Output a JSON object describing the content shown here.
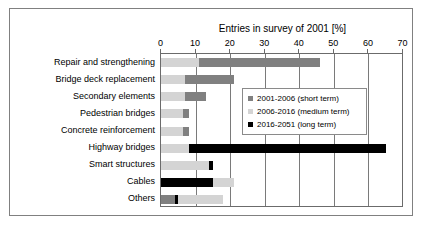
{
  "chart_data": {
    "type": "bar",
    "orientation": "horizontal",
    "stacked": true,
    "title": "Entries in survey of 2001 [%]",
    "xlabel": "",
    "ylabel": "",
    "xlim": [
      0,
      70
    ],
    "xticks": [
      0,
      10,
      20,
      30,
      40,
      50,
      60,
      70
    ],
    "grid": true,
    "legend_position": "inside-right",
    "categories": [
      "Repair and strengthening",
      "Bridge deck replacement",
      "Secondary elements",
      "Pedestrian bridges",
      "Concrete reinforcement",
      "Highway bridges",
      "Smart structures",
      "Cables",
      "Others"
    ],
    "series": [
      {
        "name": "2001-2006 (short term)",
        "color": "#808080",
        "values": [
          35,
          14,
          6,
          1.5,
          1.5,
          0,
          0,
          0,
          4
        ]
      },
      {
        "name": "2006-2016 (medium term)",
        "color": "#d4d4d4",
        "values": [
          11,
          7,
          7,
          6.5,
          6.5,
          8,
          14,
          6,
          13
        ]
      },
      {
        "name": "2016-2051 (long term)",
        "color": "#000000",
        "values": [
          0,
          0,
          0,
          0,
          0,
          57,
          1,
          15,
          1
        ]
      }
    ],
    "stack_order": [
      [
        "2006-2016 (medium term)",
        "2001-2006 (short term)"
      ],
      [
        "2006-2016 (medium term)",
        "2001-2006 (short term)"
      ],
      [
        "2006-2016 (medium term)",
        "2001-2006 (short term)"
      ],
      [
        "2006-2016 (medium term)",
        "2001-2006 (short term)"
      ],
      [
        "2006-2016 (medium term)",
        "2001-2006 (short term)"
      ],
      [
        "2006-2016 (medium term)",
        "2016-2051 (long term)"
      ],
      [
        "2006-2016 (medium term)",
        "2016-2051 (long term)"
      ],
      [
        "2016-2051 (long term)",
        "2006-2016 (medium term)"
      ],
      [
        "2001-2006 (short term)",
        "2016-2051 (long term)",
        "2006-2016 (medium term)"
      ]
    ],
    "totals": [
      46,
      21,
      13,
      8,
      8,
      65,
      15,
      21,
      18
    ],
    "bar_segments": [
      [
        {
          "series": "2006-2016 (medium term)",
          "start": 0,
          "end": 11
        },
        {
          "series": "2001-2006 (short term)",
          "start": 11,
          "end": 46
        }
      ],
      [
        {
          "series": "2006-2016 (medium term)",
          "start": 0,
          "end": 7
        },
        {
          "series": "2001-2006 (short term)",
          "start": 7,
          "end": 21
        }
      ],
      [
        {
          "series": "2006-2016 (medium term)",
          "start": 0,
          "end": 7
        },
        {
          "series": "2001-2006 (short term)",
          "start": 7,
          "end": 13
        }
      ],
      [
        {
          "series": "2006-2016 (medium term)",
          "start": 0,
          "end": 6.5
        },
        {
          "series": "2001-2006 (short term)",
          "start": 6.5,
          "end": 8
        }
      ],
      [
        {
          "series": "2006-2016 (medium term)",
          "start": 0,
          "end": 6.5
        },
        {
          "series": "2001-2006 (short term)",
          "start": 6.5,
          "end": 8
        }
      ],
      [
        {
          "series": "2006-2016 (medium term)",
          "start": 0,
          "end": 8
        },
        {
          "series": "2016-2051 (long term)",
          "start": 8,
          "end": 65
        }
      ],
      [
        {
          "series": "2006-2016 (medium term)",
          "start": 0,
          "end": 14
        },
        {
          "series": "2016-2051 (long term)",
          "start": 14,
          "end": 15
        }
      ],
      [
        {
          "series": "2016-2051 (long term)",
          "start": 0,
          "end": 15
        },
        {
          "series": "2006-2016 (medium term)",
          "start": 15,
          "end": 21
        }
      ],
      [
        {
          "series": "2001-2006 (short term)",
          "start": 0,
          "end": 4
        },
        {
          "series": "2016-2051 (long term)",
          "start": 4,
          "end": 5
        },
        {
          "series": "2006-2016 (medium term)",
          "start": 5,
          "end": 18
        }
      ]
    ]
  },
  "legend": {
    "items": [
      {
        "label": "2001-2006 (short term)",
        "color": "#808080"
      },
      {
        "label": "2006-2016 (medium term)",
        "color": "#d4d4d4"
      },
      {
        "label": "2016-2051 (long term)",
        "color": "#000000"
      }
    ]
  }
}
